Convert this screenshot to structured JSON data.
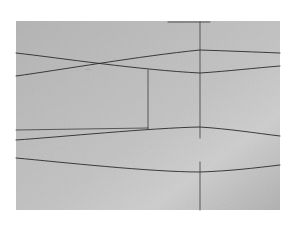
{
  "image": {
    "description": "Photograph of a pencil line drawing on gray paper",
    "background_color": "#ffffff",
    "paper": {
      "x": 16,
      "y": 21,
      "width": 264,
      "height": 189,
      "color": "#b9b9b9",
      "highlight_color": "#cfcfcf"
    },
    "line_color": "#2a2a2a",
    "label_text": "~~~"
  },
  "drawing": {
    "curves": [
      {
        "name": "upper-curve-descending",
        "d": "M16,53 C60,58 140,70 200,73 C230,71 255,68 280,66"
      },
      {
        "name": "upper-curve-ascending",
        "d": "M16,76 C60,70 140,56 200,50 C230,51 255,52 280,53"
      },
      {
        "name": "middle-curve",
        "d": "M16,140 C60,137 150,128 200,127 C230,129 255,133 280,136"
      },
      {
        "name": "lower-curve",
        "d": "M16,158 C60,162 150,172 200,172 C230,171 255,168 280,165"
      }
    ],
    "straights": [
      {
        "name": "vertical-line-upper",
        "x1": 200,
        "y1": 22,
        "x2": 200,
        "y2": 138
      },
      {
        "name": "vertical-line-lower",
        "x1": 200,
        "y1": 162,
        "x2": 200,
        "y2": 210
      },
      {
        "name": "box-vertical-line",
        "x1": 148,
        "y1": 70,
        "x2": 148,
        "y2": 129
      },
      {
        "name": "box-horizontal-line",
        "x1": 16,
        "y1": 130,
        "x2": 148,
        "y2": 128
      },
      {
        "name": "top-short-line",
        "x1": 168,
        "y1": 22,
        "x2": 210,
        "y2": 22
      }
    ]
  }
}
